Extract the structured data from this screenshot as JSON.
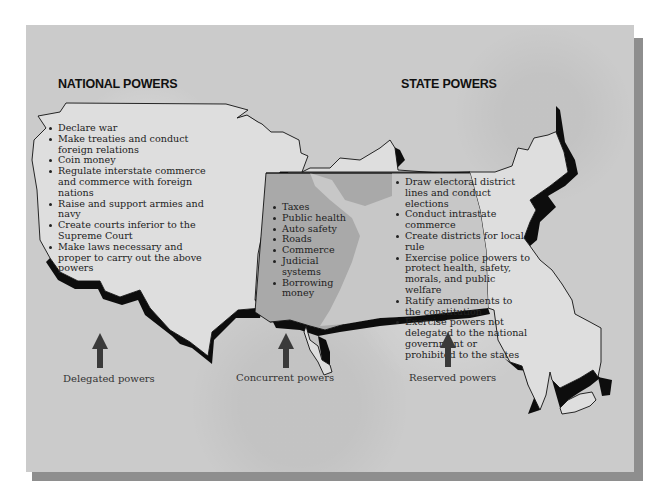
{
  "diagram": {
    "headings": {
      "national": "NATIONAL POWERS",
      "state": "STATE POWERS"
    },
    "national_powers": [
      "Declare war",
      "Make treaties and conduct foreign relations",
      "Coin money",
      "Regulate interstate commerce and commerce with foreign nations",
      "Raise and support armies and navy",
      "Create courts inferior to the Supreme Court",
      "Make laws necessary and proper to carry out the above powers"
    ],
    "concurrent_powers": [
      "Taxes",
      "Public health",
      "Auto safety",
      "Roads",
      "Commerce",
      "Judicial systems",
      "Borrowing money"
    ],
    "state_powers": [
      "Draw electoral district lines and conduct elections",
      "Conduct intrastate commerce",
      "Create districts for local rule",
      "Exercise police powers to protect health, safety, morals, and public welfare",
      "Ratify amendments to the constitution",
      "Exercise powers not delegated to the national government or prohibited to the states"
    ],
    "arrow_labels": {
      "delegated": "Delegated powers",
      "concurrent": "Concurrent powers",
      "reserved": "Reserved powers"
    },
    "colors": {
      "background": "#cbcbcb",
      "map_fill": "#dedede",
      "concurrent_fill": "#a9a9a9",
      "shadow": "#8e8e8e",
      "outline": "#111111",
      "arrow": "#3a3a3a"
    }
  }
}
